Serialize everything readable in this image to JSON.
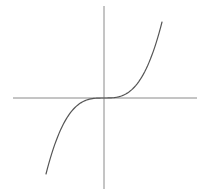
{
  "chart_data": {
    "type": "line",
    "title": "",
    "xlabel": "",
    "ylabel": "",
    "function": "y = x^3",
    "xlim": [
      -1.0,
      1.0
    ],
    "ylim": [
      -1.0,
      1.0
    ],
    "grid": false,
    "legend": null,
    "series": [
      {
        "name": "y = x^3",
        "x": [
          -1.0,
          -0.75,
          -0.5,
          -0.25,
          0.0,
          0.25,
          0.5,
          0.75,
          1.0
        ],
        "y": [
          -1.0,
          -0.421875,
          -0.125,
          -0.015625,
          0.0,
          0.015625,
          0.125,
          0.421875,
          1.0
        ]
      }
    ]
  },
  "layout": {
    "origin_px": [
      104,
      98
    ],
    "x_axis_px": [
      13,
      197
    ],
    "y_axis_px": [
      6,
      189
    ],
    "x_scale_px": 58,
    "y_scale_px": 76,
    "curve_color": "#555555",
    "axis_color": "#8a8a8a",
    "background": "#ffffff"
  }
}
